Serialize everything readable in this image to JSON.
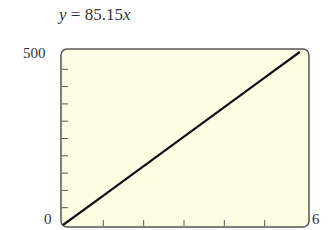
{
  "chart_data": {
    "type": "line",
    "title": "y = 85.15x",
    "equation": {
      "lhs": "y",
      "coefficient": "85.15",
      "variable": "x"
    },
    "xlabel": "",
    "ylabel": "",
    "xlim": [
      0,
      6
    ],
    "ylim": [
      0,
      500
    ],
    "x_tick_step": 1,
    "y_tick_step": 50,
    "x_tick_labels": [
      "0",
      "6"
    ],
    "y_tick_labels": [
      "0",
      "500"
    ],
    "grid": false,
    "series": [
      {
        "name": "y = 85.15x",
        "x": [
          0,
          1,
          2,
          3,
          4,
          5,
          5.87
        ],
        "y": [
          0,
          85.15,
          170.3,
          255.45,
          340.6,
          425.75,
          500
        ]
      }
    ],
    "background_color": "#fdfde3",
    "line_color": "#111111"
  }
}
